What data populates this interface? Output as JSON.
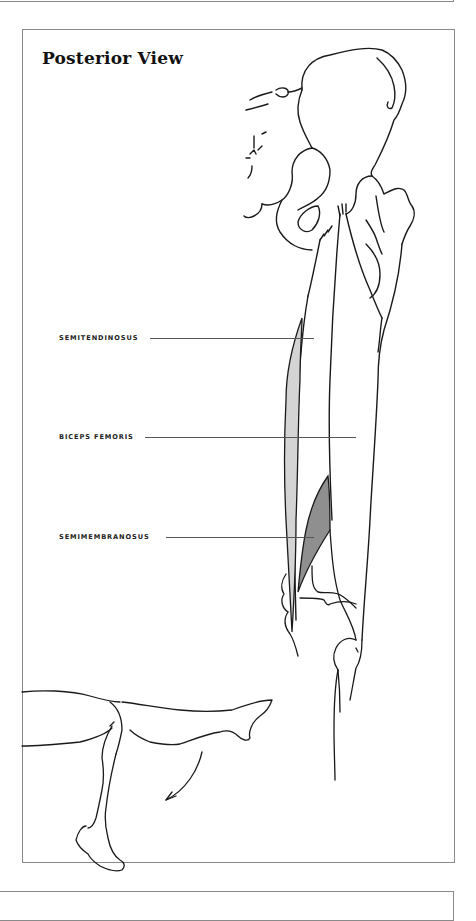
{
  "figure": {
    "title": "Posterior View",
    "labels": [
      {
        "id": "semitendinosus",
        "text": "SEMITENDINOSUS"
      },
      {
        "id": "biceps-femoris",
        "text": "BICEPS FEMORIS"
      },
      {
        "id": "semimembranosus",
        "text": "SEMIMEMBRANOSUS"
      }
    ],
    "colors": {
      "line": "#1a1a1a",
      "semitendinosus_fill": "#d4d4d4",
      "semimembranosus_fill": "#8f8f8f",
      "border": "#8a8a8a"
    },
    "inset": {
      "description": "knee flexion movement illustration",
      "icon": "curved-arrow-icon"
    }
  }
}
